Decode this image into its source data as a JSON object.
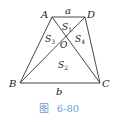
{
  "figure": {
    "points": {
      "A": {
        "label": "A",
        "x": 52,
        "y": 17
      },
      "D": {
        "label": "D",
        "x": 85,
        "y": 17
      },
      "B": {
        "label": "B",
        "x": 20,
        "y": 83
      },
      "C": {
        "label": "C",
        "x": 100,
        "y": 83
      },
      "O": {
        "label": "O",
        "x": 64,
        "y": 38
      }
    },
    "sides": {
      "top": "a",
      "bottom": "b"
    },
    "regions": {
      "S1": {
        "main": "S",
        "sub": "1"
      },
      "S2": {
        "main": "S",
        "sub": "2"
      },
      "S3": {
        "main": "S",
        "sub": "3"
      },
      "S4": {
        "main": "S",
        "sub": "4"
      }
    },
    "line_color": "#333333"
  },
  "caption": {
    "prefix": "图",
    "number": "6-80",
    "color": "#6aa0d8"
  }
}
